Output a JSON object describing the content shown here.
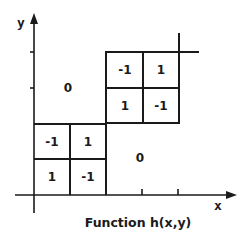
{
  "diagram": {
    "caption": "Function h(x,y)",
    "axes": {
      "x_label": "x",
      "y_label": "y"
    },
    "regions": {
      "upper_left_value": "0",
      "lower_right_value": "0"
    },
    "upper_grid": {
      "cells": [
        [
          "-1",
          "1"
        ],
        [
          "1",
          "-1"
        ]
      ]
    },
    "lower_grid": {
      "cells": [
        [
          "-1",
          "1"
        ],
        [
          "1",
          "-1"
        ]
      ]
    },
    "colors": {
      "ink": "#1a1a1a",
      "background": "#ffffff"
    }
  }
}
